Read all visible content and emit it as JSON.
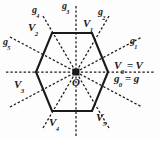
{
  "figure": {
    "type": "hexagon-symmetry-diagram",
    "center_label": "O",
    "background_color": "#fdfdfd",
    "stroke_color": "#1a1a1a",
    "vertices": [
      {
        "name": "V0",
        "base": "V",
        "sub": "0",
        "text": "V",
        "subtext": "0",
        "angle_deg": 0
      },
      {
        "name": "V1",
        "base": "V",
        "sub": "1",
        "text": "V",
        "subtext": "1",
        "angle_deg": 60
      },
      {
        "name": "V2",
        "base": "V",
        "sub": "2",
        "text": "V",
        "subtext": "2",
        "angle_deg": 120
      },
      {
        "name": "V3",
        "base": "V",
        "sub": "3",
        "text": "V",
        "subtext": "3",
        "angle_deg": 180
      },
      {
        "name": "V4",
        "base": "V",
        "sub": "4",
        "text": "V",
        "subtext": "4",
        "angle_deg": 240
      },
      {
        "name": "V5",
        "base": "V",
        "sub": "5",
        "text": "V",
        "subtext": "5",
        "angle_deg": 300
      }
    ],
    "axes": [
      {
        "name": "g0",
        "base": "g",
        "sub": "0",
        "angle_deg": 0
      },
      {
        "name": "g1",
        "base": "g",
        "sub": "1",
        "angle_deg": 30
      },
      {
        "name": "g2",
        "base": "g",
        "sub": "2",
        "angle_deg": 60
      },
      {
        "name": "g3",
        "base": "g",
        "sub": "3",
        "angle_deg": 90
      },
      {
        "name": "g4",
        "base": "g",
        "sub": "4",
        "angle_deg": 120
      },
      {
        "name": "g5",
        "base": "g",
        "sub": "5",
        "angle_deg": 150
      }
    ],
    "identities": [
      {
        "name": "V0-identity",
        "lhs_base": "V",
        "lhs_sub": "0",
        "eq": "=",
        "rhs": "V"
      },
      {
        "name": "g0-identity",
        "lhs_base": "g",
        "lhs_sub": "0",
        "eq": "=",
        "rhs": "g"
      }
    ],
    "labels": {
      "g3": {
        "base": "g",
        "sub": "3"
      },
      "g4": {
        "base": "g",
        "sub": "4"
      },
      "g5": {
        "base": "g",
        "sub": "5"
      },
      "g2": {
        "base": "g",
        "sub": "2"
      },
      "g1": {
        "base": "g",
        "sub": "1"
      },
      "V1": {
        "base": "V",
        "sub": "1"
      },
      "V2": {
        "base": "V",
        "sub": "2"
      },
      "V3": {
        "base": "V",
        "sub": "3"
      },
      "V4": {
        "base": "V",
        "sub": "4"
      },
      "V5": {
        "base": "V",
        "sub": "5"
      },
      "V0": {
        "base": "V",
        "sub": "0"
      },
      "g0": {
        "base": "g",
        "sub": "0"
      },
      "center": {
        "base": "O",
        "sub": ""
      },
      "V_plain": "V",
      "g_plain": "g",
      "equals": "="
    }
  }
}
